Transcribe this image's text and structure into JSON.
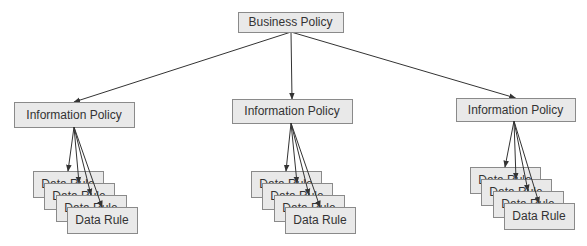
{
  "diagram": {
    "type": "hierarchy",
    "colors": {
      "box_fill": "#e9e9e9",
      "box_stroke": "#8a8a8a",
      "text": "#333333",
      "edge": "#333333"
    },
    "root": {
      "label": "Business Policy",
      "x": 238,
      "y": 12,
      "w": 105,
      "h": 20
    },
    "children": [
      {
        "label": "Information Policy",
        "x": 14,
        "y": 102,
        "w": 120,
        "h": 25,
        "rules": {
          "label": "Data Rule",
          "count": 4,
          "front": {
            "x": 67,
            "y": 207
          },
          "origin": [
            74,
            127
          ]
        }
      },
      {
        "label": "Information Policy",
        "x": 232,
        "y": 99,
        "w": 120,
        "h": 24,
        "rules": {
          "label": "Data Rule",
          "count": 4,
          "front": {
            "x": 285,
            "y": 207
          },
          "origin": [
            291,
            123
          ]
        }
      },
      {
        "label": "Information Policy",
        "x": 456,
        "y": 98,
        "w": 119,
        "h": 23,
        "rules": {
          "label": "Data Rule",
          "count": 4,
          "front": {
            "x": 504,
            "y": 203
          },
          "origin": [
            514,
            121
          ]
        }
      }
    ],
    "rule_box": {
      "w": 70,
      "h": 26,
      "dx": 11.3,
      "dy": 12
    }
  }
}
